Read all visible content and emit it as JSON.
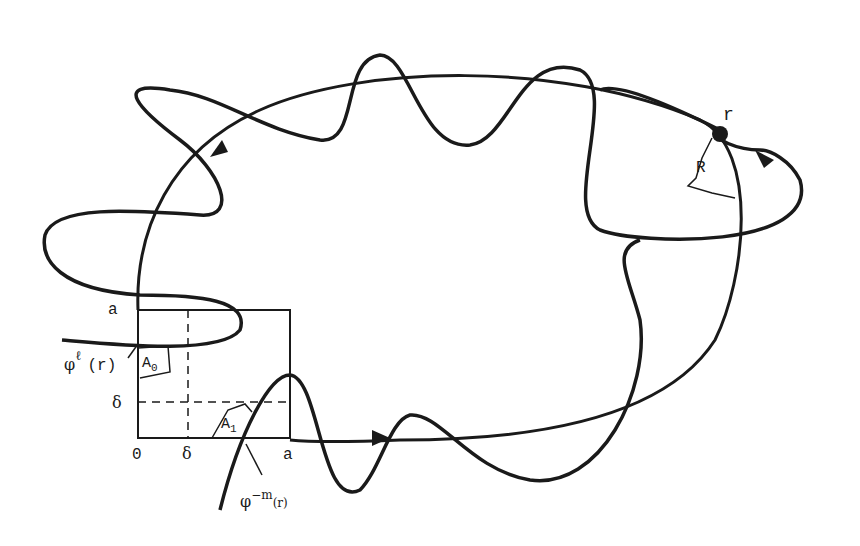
{
  "figure": {
    "type": "homoclinic tangle diagram",
    "labels": {
      "point_r": "r",
      "region_R": "R",
      "axis_origin": "0",
      "axis_delta_x": "δ",
      "axis_a_x": "a",
      "axis_delta_y": "δ",
      "axis_a_y": "a",
      "region_A0_base": "A",
      "region_A0_sub": "0",
      "region_A1_base": "A",
      "region_A1_sub": "1",
      "phi_l_base": "φ",
      "phi_l_sup": "ℓ",
      "phi_l_arg": "(r)",
      "phi_m_base": "φ",
      "phi_m_sup": "−m",
      "phi_m_arg": "(r)"
    },
    "colors": {
      "stroke": "#1a1a1a",
      "background": "#ffffff"
    }
  }
}
